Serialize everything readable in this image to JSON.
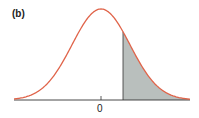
{
  "chart_data": {
    "type": "area",
    "title": "(b)",
    "x_tick_labels": [
      "0"
    ],
    "xlabel": "",
    "ylabel": "",
    "curve": "normal pdf, mean 0",
    "shaded_region": {
      "from_z": 0.7,
      "to_z": "infinity",
      "side": "right tail"
    },
    "xlim": [
      -3,
      3
    ],
    "grid": false,
    "legend": null,
    "colors": {
      "curve": "#e0644a",
      "shade": "#b9bfbd",
      "axis": "#333333"
    }
  },
  "labels": {
    "panel": "(b)",
    "zero": "0"
  }
}
